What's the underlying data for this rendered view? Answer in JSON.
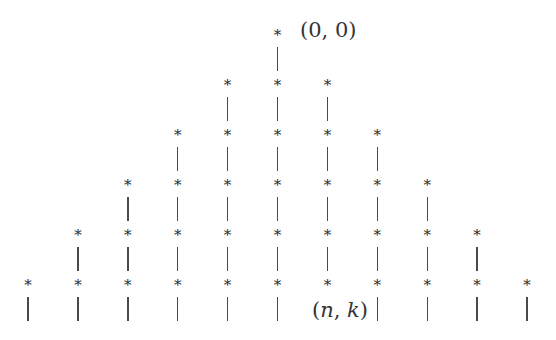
{
  "diagram": {
    "node_glyph": "*",
    "edge_glyph": "|",
    "colors": {
      "node": "#2b2b2b",
      "edge": "#4a4a4a",
      "label": "#333333",
      "background": "#ffffff"
    },
    "grid": {
      "columns": 11,
      "col_x0": 28,
      "col_dx": 49.9,
      "rows": 6,
      "row_y0": 35,
      "row_dy": 50,
      "bar_offset_top": 12,
      "bar_length": 24
    },
    "rows": [
      {
        "row": 0,
        "cols": [
          5
        ]
      },
      {
        "row": 1,
        "cols": [
          4,
          5,
          6
        ]
      },
      {
        "row": 2,
        "cols": [
          3,
          4,
          5,
          6,
          7
        ]
      },
      {
        "row": 3,
        "cols": [
          2,
          3,
          4,
          5,
          6,
          7,
          8
        ]
      },
      {
        "row": 4,
        "cols": [
          1,
          2,
          3,
          4,
          5,
          6,
          7,
          8,
          9
        ]
      },
      {
        "row": 5,
        "cols": [
          0,
          1,
          2,
          3,
          4,
          5,
          6,
          7,
          8,
          9,
          10
        ],
        "no_bar_cols": [
          6
        ]
      }
    ],
    "labels": [
      {
        "id": "origin-label",
        "open": "(",
        "a": "0",
        "sep": ", ",
        "b": "0",
        "close": ")",
        "italic": false,
        "x": 300,
        "y": 18
      },
      {
        "id": "nk-label",
        "open": "(",
        "a": "n",
        "sep": ", ",
        "b": "k",
        "close": ")",
        "italic": true,
        "x": 312,
        "y": 298
      }
    ]
  }
}
